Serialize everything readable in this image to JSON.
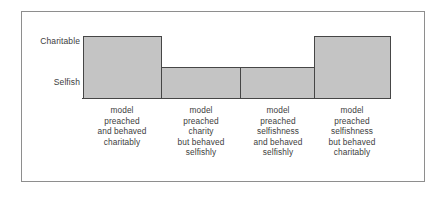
{
  "chart_data": {
    "type": "bar",
    "title": "",
    "subtitle": "",
    "xlabel": "",
    "ylabel": "",
    "grid": false,
    "legend": null,
    "y_axis": {
      "type": "categorical-ordinal",
      "ticks": [
        "Selfish",
        "Charitable"
      ],
      "tick_labels_top_to_bottom": [
        "Charitable",
        "Selfish"
      ],
      "ylim": [
        0,
        1.15
      ]
    },
    "categories": [
      "model preached and behaved charitably",
      "model preached charity but behaved selfishly",
      "model preached selfishness and behaved selfishly",
      "model preached selfishness but behaved charitably"
    ],
    "category_lines": [
      [
        "model",
        "preached",
        "and behaved",
        "charitably"
      ],
      [
        "model",
        "preached",
        "charity",
        "but behaved",
        "selfishly"
      ],
      [
        "model",
        "preached",
        "selfishness",
        "and behaved",
        "selfishly"
      ],
      [
        "model",
        "preached",
        "selfishness",
        "but behaved",
        "charitably"
      ]
    ],
    "values": [
      1.0,
      0.4,
      0.4,
      1.0
    ],
    "value_labels": [
      "Charitable",
      "between Selfish and Charitable",
      "between Selfish and Charitable",
      "Charitable"
    ],
    "bar_fill": "#c4c4c4",
    "bar_edge": "#464646",
    "frame_color": "#8e8e8e",
    "background": "#ffffff"
  },
  "axis": {
    "charitable": "Charitable",
    "selfish": "Selfish"
  },
  "bars": [
    {
      "id": "bar-1",
      "left": 61,
      "width": 79,
      "top": 24,
      "height": 63
    },
    {
      "id": "bar-2",
      "left": 139,
      "width": 80,
      "top": 55,
      "height": 32
    },
    {
      "id": "bar-3",
      "left": 218,
      "width": 75,
      "top": 55,
      "height": 32
    },
    {
      "id": "bar-4",
      "left": 292,
      "width": 77,
      "top": 24,
      "height": 63
    }
  ],
  "xlabels": [
    {
      "id": "xlabel-1",
      "left": 32,
      "width": 136
    },
    {
      "id": "xlabel-2",
      "left": 111,
      "width": 136
    },
    {
      "id": "xlabel-3",
      "left": 188,
      "width": 136
    },
    {
      "id": "xlabel-4",
      "left": 262,
      "width": 136
    }
  ]
}
